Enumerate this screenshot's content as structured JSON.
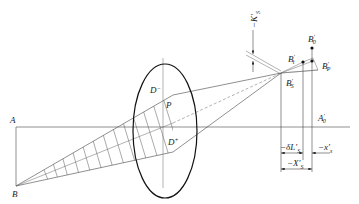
{
  "figure": {
    "labels": {
      "object_axis_point": "A",
      "object_point": "B",
      "pupil_upper": "D",
      "pupil_upper_sup": "−",
      "pupil_lower": "D",
      "pupil_lower_sup": "+",
      "pupil_center": "P",
      "sagittal_image": "B",
      "sagittal_image_sub": "S",
      "tangential_image": "B",
      "tangential_image_sub": "t",
      "gaussian_image": "B",
      "gaussian_image_sub": "0",
      "petzval_image": "B",
      "petzval_image_sub": "P",
      "image_axis_point": "A",
      "image_axis_point_sub": "0",
      "prime": "′"
    },
    "dimensions": {
      "coma_sagittal": "−K′",
      "coma_sagittal_sub": "S",
      "delta_L": "−δL′",
      "delta_L_sub": "S",
      "x_s": "−x′",
      "x_s_sub": "s",
      "X_S": "−X′",
      "X_S_sub": "S"
    },
    "colors": {
      "line": "#444444",
      "heavy": "#111111",
      "background": "#ffffff"
    }
  }
}
